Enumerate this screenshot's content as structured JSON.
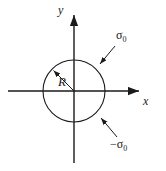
{
  "figure": {
    "name": "circular-region-uniform-stress-diagram",
    "type": "2d-cartesian-schematic",
    "width": 166,
    "height": 171,
    "background_color": "#ffffff",
    "stroke_color": "#1a1a1a"
  },
  "axes": {
    "x": {
      "label": "x",
      "orientation": "horizontal",
      "arrow": "right",
      "start_px": [
        8,
        91
      ],
      "end_px": [
        141,
        91
      ]
    },
    "y": {
      "label": "y",
      "orientation": "vertical",
      "arrow": "up",
      "start_px": [
        74,
        163
      ],
      "end_px": [
        74,
        13
      ]
    },
    "origin_px": [
      74,
      91
    ]
  },
  "shapes": {
    "circle": {
      "name": "circle",
      "center_px": [
        74,
        91
      ],
      "radius_px": 31,
      "fill": "none",
      "stroke": "#1a1a1a"
    }
  },
  "annotations": {
    "radius": {
      "label": "R",
      "style": "italic",
      "arrow_from_px": [
        74,
        91
      ],
      "arrow_to_px": [
        52,
        69
      ]
    },
    "outer_stress": {
      "label": "σ0",
      "symbol": "σ",
      "subscript": "0",
      "arrow_from_px": [
        115,
        46
      ],
      "arrow_to_px": [
        99,
        65
      ]
    },
    "inner_stress": {
      "label": "-σ0",
      "symbol": "−σ",
      "subscript": "0",
      "arrow_from_px": [
        117,
        137
      ],
      "arrow_to_px": [
        100,
        117
      ]
    }
  }
}
